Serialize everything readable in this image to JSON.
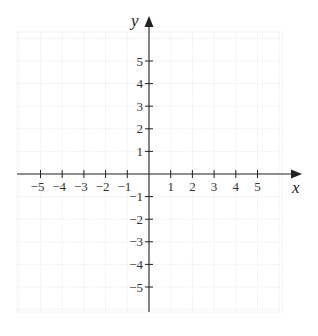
{
  "figure": {
    "type": "cartesian-coordinate-plane",
    "x_axis": {
      "label": "x",
      "min": -5,
      "max": 5,
      "ticks": [
        -5,
        -4,
        -3,
        -2,
        -1,
        1,
        2,
        3,
        4,
        5
      ],
      "tick_labels": [
        "−5",
        "−4",
        "−3",
        "−2",
        "−1",
        "1",
        "2",
        "3",
        "4",
        "5"
      ],
      "arrow": "right"
    },
    "y_axis": {
      "label": "y",
      "min": -5,
      "max": 5,
      "ticks": [
        5,
        4,
        3,
        2,
        1,
        -1,
        -2,
        -3,
        -4,
        -5
      ],
      "tick_labels": [
        "5",
        "4",
        "3",
        "2",
        "1",
        "−1",
        "−2",
        "−3",
        "−4",
        "−5"
      ],
      "arrow": "up"
    },
    "grid": {
      "visible": true,
      "style": "dotted",
      "color": "#e6e6e6",
      "cells_x": 12,
      "cells_y": 13
    },
    "colors": {
      "axis": "#222222",
      "text": "#333333",
      "background": "#ffffff"
    }
  }
}
